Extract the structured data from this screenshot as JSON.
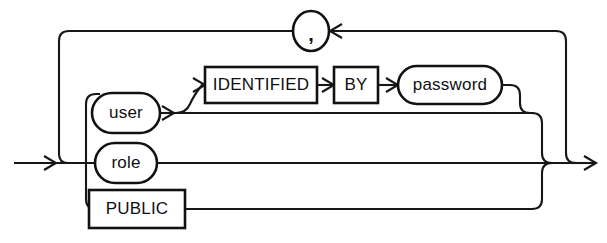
{
  "diagram": {
    "kind": "railroad-syntax-diagram",
    "background_color": "#ffffff",
    "line_color": "#17171a",
    "text_color": "#101013",
    "entry_arrow": "entry-arrow-left",
    "exit_arrow": "exit-arrow-right",
    "nodes": [
      {
        "id": "user",
        "label": "user",
        "shape": "stadium",
        "role": "nonterminal",
        "cx": 126,
        "cy": 113,
        "w": 68,
        "h": 40
      },
      {
        "id": "role",
        "label": "role",
        "shape": "stadium",
        "role": "nonterminal",
        "cx": 126,
        "cy": 163,
        "w": 62,
        "h": 40
      },
      {
        "id": "public",
        "label": "PUBLIC",
        "shape": "rectangle",
        "role": "keyword",
        "cx": 137,
        "cy": 209,
        "w": 96,
        "h": 38
      },
      {
        "id": "identified",
        "label": "IDENTIFIED",
        "shape": "rectangle",
        "role": "keyword",
        "cx": 261,
        "cy": 85,
        "w": 112,
        "h": 36
      },
      {
        "id": "by",
        "label": "BY",
        "shape": "rectangle",
        "role": "keyword",
        "cx": 356,
        "cy": 85,
        "w": 44,
        "h": 36
      },
      {
        "id": "password",
        "label": "password",
        "shape": "stadium",
        "role": "nonterminal",
        "cx": 450,
        "cy": 85,
        "w": 104,
        "h": 38
      },
      {
        "id": "comma",
        "label": ",",
        "shape": "oval",
        "role": "separator",
        "cx": 311,
        "cy": 31,
        "w": 36,
        "h": 40
      }
    ],
    "edges": [
      {
        "id": "entry",
        "from": "entry-arrow-left",
        "to": "branch-fan"
      },
      {
        "id": "branch-user",
        "from": "branch-fan",
        "to": "user"
      },
      {
        "id": "branch-role",
        "from": "branch-fan",
        "to": "role"
      },
      {
        "id": "branch-public",
        "from": "branch-fan",
        "to": "public"
      },
      {
        "id": "user-to-ident",
        "from": "user",
        "to": "identified"
      },
      {
        "id": "user-bypass",
        "from": "user",
        "to": "merge-right"
      },
      {
        "id": "ident-to-by",
        "from": "identified",
        "to": "by"
      },
      {
        "id": "by-to-password",
        "from": "by",
        "to": "password"
      },
      {
        "id": "password-to-merge",
        "from": "password",
        "to": "merge-right"
      },
      {
        "id": "role-to-exit",
        "from": "role",
        "to": "exit-arrow-right"
      },
      {
        "id": "public-to-merge",
        "from": "public",
        "to": "merge-right"
      },
      {
        "id": "loop-back-comma",
        "from": "merge-right",
        "to": "comma"
      },
      {
        "id": "comma-to-branch",
        "from": "comma",
        "to": "branch-fan"
      }
    ],
    "labels": {
      "user": "user",
      "role": "role",
      "public": "PUBLIC",
      "identified": "IDENTIFIED",
      "by": "BY",
      "password": "password",
      "comma": ","
    }
  }
}
